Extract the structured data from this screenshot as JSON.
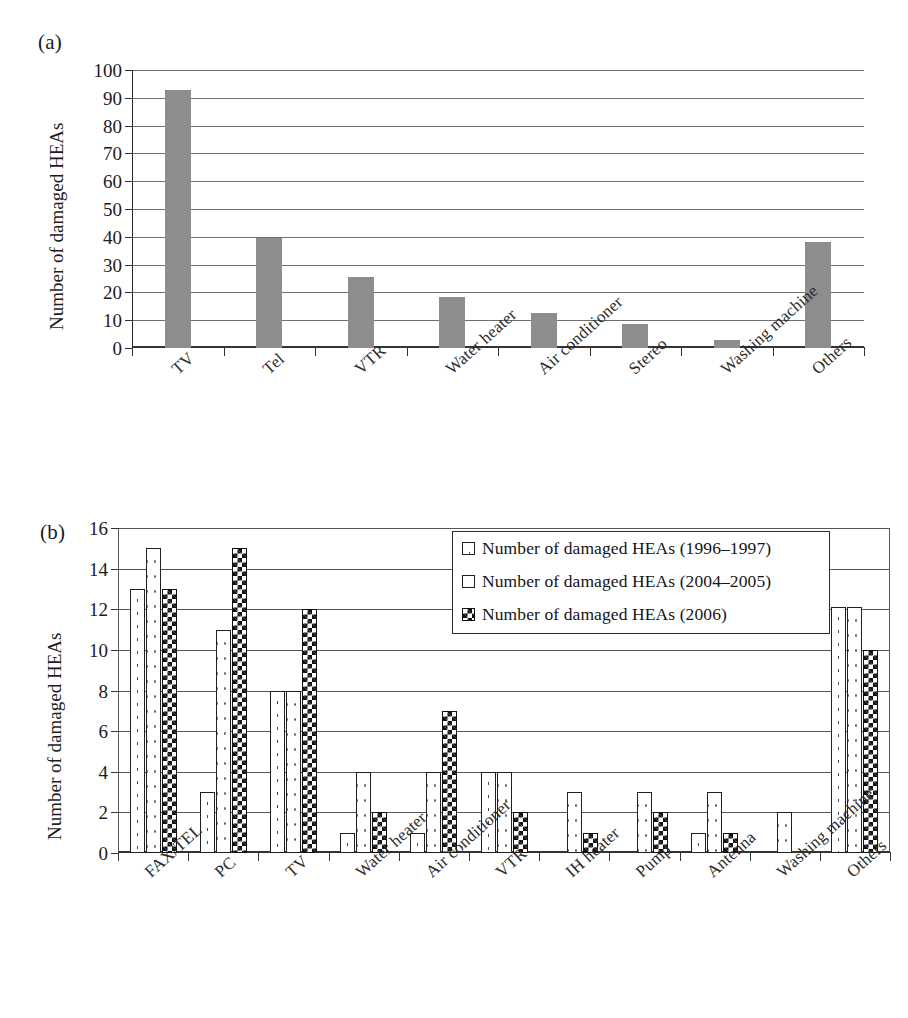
{
  "figure": {
    "panel_a_letter": "(a)",
    "panel_b_letter": "(b)"
  },
  "chart_data": [
    {
      "id": "panel-a",
      "type": "bar",
      "title": "(a)",
      "xlabel": "",
      "ylabel": "Number of damaged HEAs",
      "ylim": [
        0,
        100
      ],
      "yticks": [
        0,
        10,
        20,
        30,
        40,
        50,
        60,
        70,
        80,
        90,
        100
      ],
      "grid": true,
      "legend": "none",
      "bar_color": "#8d8d8d",
      "categories": [
        "TV",
        "Tel",
        "VTR",
        "Water heater",
        "Air conditioner",
        "Stereo",
        "Washing machine",
        "Others"
      ],
      "values": [
        93,
        39.5,
        25.5,
        18.5,
        12.5,
        8.5,
        3,
        38
      ]
    },
    {
      "id": "panel-b",
      "type": "bar",
      "title": "(b)",
      "xlabel": "",
      "ylabel": "Number of damaged HEAs",
      "ylim": [
        0,
        16
      ],
      "yticks": [
        0,
        2,
        4,
        6,
        8,
        10,
        12,
        14,
        16
      ],
      "grid": true,
      "legend_position": "top-right",
      "categories": [
        "FAX/TEL",
        "PC",
        "TV",
        "Water heater",
        "Air conditioner",
        "VTR",
        "IH heater",
        "Pump",
        "Antenna",
        "Washing machine",
        "Others"
      ],
      "series": [
        {
          "name": "Number of damaged HEAs (1996–1997)",
          "pattern": "dots",
          "values": [
            13,
            3,
            8,
            1,
            1,
            4,
            0,
            0,
            1,
            0,
            12.1
          ]
        },
        {
          "name": "Number of damaged HEAs (2004–2005)",
          "pattern": "dots-light",
          "values": [
            15,
            11,
            8,
            4,
            4,
            4,
            3,
            3,
            3,
            2,
            12.1
          ]
        },
        {
          "name": "Number of damaged HEAs (2006)",
          "pattern": "check",
          "values": [
            13,
            15,
            12,
            2,
            7,
            2,
            1,
            2,
            1,
            0,
            10
          ]
        }
      ]
    }
  ],
  "panel_a": {
    "ylabel": "Number of damaged HEAs",
    "yticks": [
      "100",
      "90",
      "80",
      "70",
      "60",
      "50",
      "40",
      "30",
      "20",
      "10",
      "0"
    ],
    "xlabels": [
      "TV",
      "Tel",
      "VTR",
      "Water heater",
      "Air conditioner",
      "Stereo",
      "Washing machine",
      "Others"
    ]
  },
  "panel_b": {
    "ylabel": "Number of damaged HEAs",
    "yticks": [
      "16",
      "14",
      "12",
      "10",
      "8",
      "6",
      "4",
      "2",
      "0"
    ],
    "xlabels": [
      "FAX/TEL",
      "PC",
      "TV",
      "Water heater",
      "Air conditioner",
      "VTR",
      "IH heater",
      "Pump",
      "Antenna",
      "Washing machine",
      "Others"
    ],
    "legend": [
      {
        "label": "Number of damaged HEAs (1996–1997)",
        "swatch": "dots"
      },
      {
        "label": "Number of damaged HEAs (2004–2005)",
        "swatch": "dots-light"
      },
      {
        "label": "Number of damaged HEAs (2006)",
        "swatch": "check"
      }
    ]
  }
}
